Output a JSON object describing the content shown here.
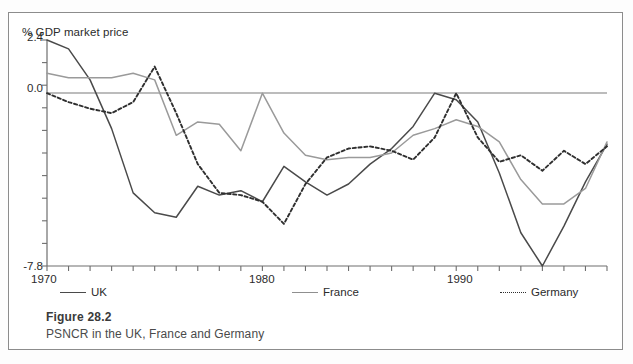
{
  "figure": {
    "number_label": "Figure 28.2",
    "caption": "PSNCR in the UK, France and Germany"
  },
  "axis": {
    "y_title": "% GDP market price",
    "y_top_label": "2.4",
    "y_zero_label": "0.0",
    "y_bottom_label": "-7.8",
    "x_labels": [
      "1970",
      "1980",
      "1990"
    ]
  },
  "legend": {
    "uk": "UK",
    "france": "France",
    "germany": "Germany"
  },
  "chart_data": {
    "type": "line",
    "title": "PSNCR in the UK, France and Germany",
    "xlabel": "",
    "ylabel": "% GDP market price",
    "ylim": [
      -7.8,
      2.4
    ],
    "xlim": [
      1970,
      1996
    ],
    "grid": false,
    "legend_position": "below-axis",
    "x": [
      1970,
      1971,
      1972,
      1973,
      1974,
      1975,
      1976,
      1977,
      1978,
      1979,
      1980,
      1981,
      1982,
      1983,
      1984,
      1985,
      1986,
      1987,
      1988,
      1989,
      1990,
      1991,
      1992,
      1993,
      1994,
      1995,
      1996
    ],
    "series": [
      {
        "name": "UK",
        "style": "solid",
        "color": "#4a4a4a",
        "values": [
          2.4,
          2.0,
          0.6,
          -1.6,
          -4.5,
          -5.4,
          -5.6,
          -4.2,
          -4.6,
          -4.4,
          -4.9,
          -3.3,
          -4.0,
          -4.6,
          -4.1,
          -3.2,
          -2.5,
          -1.5,
          0.0,
          -0.3,
          -1.3,
          -3.6,
          -6.3,
          -7.8,
          -6.0,
          -4.0,
          -2.3
        ]
      },
      {
        "name": "France",
        "style": "solid",
        "color": "#9a9a9a",
        "values": [
          0.9,
          0.7,
          0.7,
          0.7,
          0.9,
          0.6,
          -1.9,
          -1.3,
          -1.4,
          -2.6,
          0.0,
          -1.8,
          -2.8,
          -3.0,
          -2.9,
          -2.9,
          -2.7,
          -1.9,
          -1.6,
          -1.2,
          -1.5,
          -2.2,
          -3.9,
          -5.0,
          -5.0,
          -4.3,
          -2.2
        ]
      },
      {
        "name": "Germany",
        "style": "dotted",
        "color": "#2f2f2f",
        "values": [
          0.0,
          -0.4,
          -0.7,
          -0.9,
          -0.4,
          1.2,
          -0.9,
          -3.2,
          -4.5,
          -4.6,
          -4.9,
          -5.9,
          -4.1,
          -2.9,
          -2.5,
          -2.4,
          -2.6,
          -3.0,
          -2.0,
          0.0,
          -2.0,
          -3.1,
          -2.8,
          -3.5,
          -2.6,
          -3.2,
          -2.4
        ]
      }
    ]
  }
}
